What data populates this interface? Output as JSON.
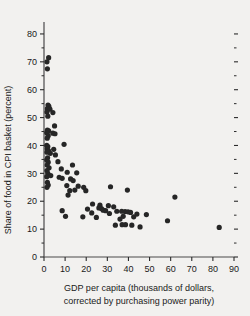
{
  "chart_data": {
    "type": "scatter",
    "title": "",
    "xlabel": "GDP per capita (thousands of dollars, corrected by purchasing power parity)",
    "xlabel_line1": "GDP per capita (thousands of dollars,",
    "xlabel_line2": "corrected by purchasing power parity)",
    "ylabel": "Share of food in CPI basket (percent)",
    "xlim": [
      0,
      90
    ],
    "ylim": [
      0,
      85
    ],
    "xticks": [
      0,
      10,
      20,
      30,
      40,
      50,
      60,
      70,
      80,
      90
    ],
    "yticks": [
      0,
      10,
      20,
      30,
      40,
      50,
      60,
      70,
      80
    ],
    "xtick_labels": [
      "0",
      "10",
      "20",
      "30",
      "40",
      "50",
      "60",
      "70",
      "80",
      "90"
    ],
    "ytick_labels": [
      "0",
      "10",
      "20",
      "30",
      "40",
      "50",
      "60",
      "70",
      "80"
    ],
    "y_minor_ticks": [
      5,
      15,
      25,
      35,
      45,
      55,
      65,
      75
    ],
    "grid": false,
    "legend": "none",
    "marker_color": "#262626",
    "marker_size": 2.6,
    "right_axis_ticks": true,
    "points": [
      {
        "x": 2.2,
        "y": 71.5
      },
      {
        "x": 1.4,
        "y": 70.0
      },
      {
        "x": 1.6,
        "y": 67.5
      },
      {
        "x": 1.9,
        "y": 54.5
      },
      {
        "x": 2.3,
        "y": 54.0
      },
      {
        "x": 1.6,
        "y": 53.2
      },
      {
        "x": 2.8,
        "y": 53.0
      },
      {
        "x": 1.4,
        "y": 52.0
      },
      {
        "x": 4.2,
        "y": 51.8
      },
      {
        "x": 1.8,
        "y": 50.5
      },
      {
        "x": 5.0,
        "y": 47.0
      },
      {
        "x": 1.6,
        "y": 45.5
      },
      {
        "x": 2.2,
        "y": 45.2
      },
      {
        "x": 1.3,
        "y": 44.6
      },
      {
        "x": 4.2,
        "y": 44.4
      },
      {
        "x": 5.2,
        "y": 44.2
      },
      {
        "x": 2.0,
        "y": 43.5
      },
      {
        "x": 1.5,
        "y": 42.6
      },
      {
        "x": 9.5,
        "y": 40.4
      },
      {
        "x": 1.3,
        "y": 40.0
      },
      {
        "x": 1.8,
        "y": 39.6
      },
      {
        "x": 1.5,
        "y": 38.8
      },
      {
        "x": 4.6,
        "y": 38.6
      },
      {
        "x": 2.1,
        "y": 38.2
      },
      {
        "x": 1.4,
        "y": 37.6
      },
      {
        "x": 3.0,
        "y": 37.2
      },
      {
        "x": 5.4,
        "y": 36.6
      },
      {
        "x": 1.7,
        "y": 35.6
      },
      {
        "x": 1.3,
        "y": 34.8
      },
      {
        "x": 2.0,
        "y": 34.0
      },
      {
        "x": 6.6,
        "y": 34.2
      },
      {
        "x": 1.5,
        "y": 33.0
      },
      {
        "x": 13.5,
        "y": 33.0
      },
      {
        "x": 2.4,
        "y": 32.0
      },
      {
        "x": 8.2,
        "y": 31.6
      },
      {
        "x": 1.4,
        "y": 31.0
      },
      {
        "x": 11.0,
        "y": 30.4
      },
      {
        "x": 1.8,
        "y": 30.0
      },
      {
        "x": 15.5,
        "y": 30.2
      },
      {
        "x": 3.2,
        "y": 29.2
      },
      {
        "x": 1.3,
        "y": 28.8
      },
      {
        "x": 7.2,
        "y": 28.6
      },
      {
        "x": 8.6,
        "y": 28.2
      },
      {
        "x": 12.6,
        "y": 28.0
      },
      {
        "x": 13.8,
        "y": 27.4
      },
      {
        "x": 1.6,
        "y": 26.8
      },
      {
        "x": 2.0,
        "y": 25.8
      },
      {
        "x": 1.4,
        "y": 25.0
      },
      {
        "x": 10.8,
        "y": 25.6
      },
      {
        "x": 16.2,
        "y": 25.4
      },
      {
        "x": 18.8,
        "y": 25.0
      },
      {
        "x": 31.5,
        "y": 25.2
      },
      {
        "x": 12.2,
        "y": 23.8
      },
      {
        "x": 14.6,
        "y": 24.0
      },
      {
        "x": 19.8,
        "y": 23.8
      },
      {
        "x": 11.4,
        "y": 22.2
      },
      {
        "x": 39.5,
        "y": 24.0
      },
      {
        "x": 62.0,
        "y": 21.5
      },
      {
        "x": 23.0,
        "y": 19.0
      },
      {
        "x": 26.5,
        "y": 18.6
      },
      {
        "x": 30.5,
        "y": 18.4
      },
      {
        "x": 33.0,
        "y": 18.0
      },
      {
        "x": 26.0,
        "y": 17.6
      },
      {
        "x": 27.2,
        "y": 17.4
      },
      {
        "x": 20.6,
        "y": 17.2
      },
      {
        "x": 28.0,
        "y": 16.8
      },
      {
        "x": 29.2,
        "y": 16.6
      },
      {
        "x": 34.5,
        "y": 16.4
      },
      {
        "x": 36.8,
        "y": 16.4
      },
      {
        "x": 38.4,
        "y": 16.3
      },
      {
        "x": 39.8,
        "y": 16.2
      },
      {
        "x": 41.0,
        "y": 16.0
      },
      {
        "x": 22.6,
        "y": 15.8
      },
      {
        "x": 31.0,
        "y": 15.6
      },
      {
        "x": 44.0,
        "y": 15.4
      },
      {
        "x": 48.5,
        "y": 15.2
      },
      {
        "x": 8.6,
        "y": 16.6
      },
      {
        "x": 10.2,
        "y": 14.6
      },
      {
        "x": 18.4,
        "y": 14.4
      },
      {
        "x": 24.8,
        "y": 14.2
      },
      {
        "x": 37.5,
        "y": 14.6
      },
      {
        "x": 42.5,
        "y": 14.4
      },
      {
        "x": 36.0,
        "y": 13.6
      },
      {
        "x": 58.5,
        "y": 13.0
      },
      {
        "x": 33.8,
        "y": 11.4
      },
      {
        "x": 37.0,
        "y": 11.6
      },
      {
        "x": 38.6,
        "y": 11.6
      },
      {
        "x": 41.6,
        "y": 11.4
      },
      {
        "x": 45.5,
        "y": 10.8
      },
      {
        "x": 83.0,
        "y": 10.6
      }
    ]
  }
}
